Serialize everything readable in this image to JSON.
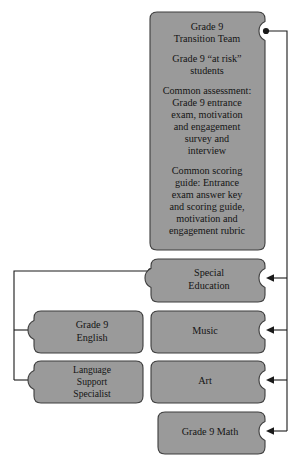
{
  "diagram": {
    "type": "puzzle-piece-flow",
    "colors": {
      "node_fill": "#9a9a9a",
      "node_stroke": "#3d3d3d",
      "connector": "#1a1a1a",
      "text": "#141414",
      "background": "#ffffff"
    },
    "nodes": [
      {
        "id": "transition-team",
        "name": "grade-9-transition-team",
        "lines": [
          "Grade 9",
          "Transition Team",
          "",
          "Grade 9 “at risk”",
          "students",
          "",
          "Common assessment:",
          "Grade 9 entrance",
          "exam, motivation",
          "and engagement",
          "survey and",
          "interview",
          "",
          "Common scoring",
          "guide: Entrance",
          "exam answer key",
          "and scoring guide,",
          "motivation and",
          "engagement rubric"
        ],
        "notches": [
          "right"
        ]
      },
      {
        "id": "special-education",
        "name": "special-education",
        "lines": [
          "Special",
          "Education"
        ],
        "notches": [
          "left",
          "right"
        ]
      },
      {
        "id": "music",
        "name": "music",
        "lines": [
          "Music"
        ],
        "notches": [
          "right"
        ]
      },
      {
        "id": "art",
        "name": "art",
        "lines": [
          "Art"
        ],
        "notches": [
          "right"
        ]
      },
      {
        "id": "grade-9-math",
        "name": "grade-9-math",
        "lines": [
          "Grade 9 Math"
        ],
        "notches": [
          "right"
        ]
      },
      {
        "id": "grade-9-english",
        "name": "grade-9-english",
        "lines": [
          "Grade 9",
          "English"
        ],
        "notches": [
          "left"
        ]
      },
      {
        "id": "language-support-specialist",
        "name": "language-support-specialist",
        "lines": [
          "Language",
          "Support",
          "Specialist"
        ],
        "notches": [
          "left"
        ]
      }
    ],
    "connections": [
      {
        "from": "transition-team",
        "to": "special-education",
        "arrow": "left"
      },
      {
        "from": "transition-team",
        "to": "music",
        "arrow": "left"
      },
      {
        "from": "transition-team",
        "to": "art",
        "arrow": "left"
      },
      {
        "from": "transition-team",
        "to": "grade-9-math",
        "arrow": "left"
      },
      {
        "from": "special-education",
        "to": "grade-9-english",
        "arrow": "right"
      },
      {
        "from": "special-education",
        "to": "language-support-specialist",
        "arrow": "right"
      }
    ]
  }
}
